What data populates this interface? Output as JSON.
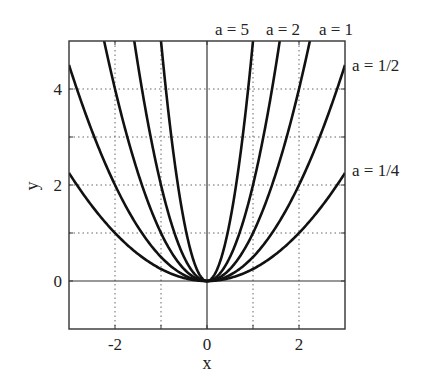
{
  "chart_data": {
    "type": "line",
    "title": "",
    "function": "y = a x^2",
    "xlabel": "x",
    "ylabel": "y",
    "xlim": [
      -3,
      3
    ],
    "ylim": [
      -1,
      5
    ],
    "xticks": [
      -2,
      0,
      2
    ],
    "yticks": [
      0,
      2,
      4
    ],
    "grid": true,
    "grid_style": "dotted",
    "grid_x": [
      -2,
      -1,
      1,
      2
    ],
    "grid_y": [
      1,
      2,
      3,
      4
    ],
    "series": [
      {
        "name": "a = 5",
        "a": 5
      },
      {
        "name": "a = 2",
        "a": 2
      },
      {
        "name": "a = 1",
        "a": 1
      },
      {
        "name": "a = 1/2",
        "a": 0.5
      },
      {
        "name": "a = 1/4",
        "a": 0.25
      }
    ],
    "annotations": [
      {
        "text": "a = 5",
        "position": "top"
      },
      {
        "text": "a = 2",
        "position": "top"
      },
      {
        "text": "a = 1",
        "position": "top"
      },
      {
        "text": "a = 1/2",
        "position": "right"
      },
      {
        "text": "a = 1/4",
        "position": "right"
      }
    ]
  },
  "labels": {
    "xlabel": "x",
    "ylabel": "y",
    "xtick_neg2": "-2",
    "xtick_0": "0",
    "xtick_2": "2",
    "ytick_0": "0",
    "ytick_2": "2",
    "ytick_4": "4",
    "ann_a5": "a = 5",
    "ann_a2": "a = 2",
    "ann_a1": "a = 1",
    "ann_a12": "a = 1/2",
    "ann_a14": "a = 1/4"
  }
}
